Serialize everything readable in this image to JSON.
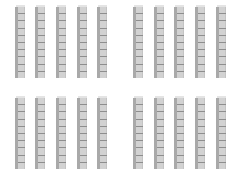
{
  "figure": {
    "groups": [
      {
        "name": "top-left",
        "x": [
          15,
          35,
          56,
          77,
          97
        ],
        "y_top": 6,
        "height": 72,
        "rods": 5
      },
      {
        "name": "top-right",
        "x": [
          133,
          154,
          174,
          195,
          216
        ],
        "y_top": 6,
        "height": 72,
        "rods": 5
      },
      {
        "name": "bottom-left",
        "x": [
          15,
          35,
          56,
          77,
          97
        ],
        "y_top": 97,
        "height": 72,
        "rods": 5
      },
      {
        "name": "bottom-right",
        "x": [
          133,
          154,
          174,
          195,
          216
        ],
        "y_top": 97,
        "height": 72,
        "rods": 5
      }
    ],
    "cubes_per_rod": 10,
    "total_rods": 20,
    "colors": {
      "face": "#d2d2d2",
      "side": "#a9a9a9",
      "line": "#8e8e8e",
      "background": "#ffffff"
    }
  }
}
